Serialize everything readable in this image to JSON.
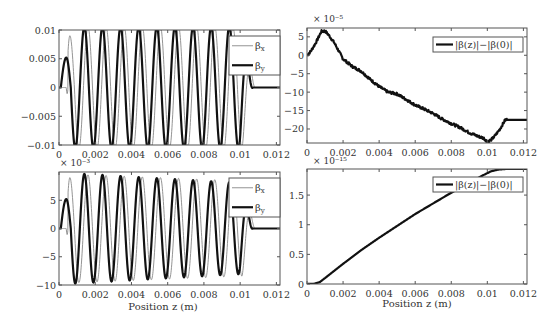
{
  "figure": {
    "width": 557,
    "height": 325,
    "background": "#ffffff",
    "axis_color": "#555555",
    "line_color": "#111111",
    "thin_line_color": "#888888"
  },
  "chart_data": [
    {
      "id": "top-left",
      "type": "line",
      "title": "",
      "xlabel": "",
      "ylabel": "",
      "xlim": [
        0,
        0.0122
      ],
      "ylim": [
        -0.01,
        0.01
      ],
      "xticks": [
        0,
        0.002,
        0.004,
        0.006,
        0.008,
        0.01,
        0.012
      ],
      "xtick_labels": [
        "0",
        "0.002",
        "0.004",
        "0.006",
        "0.008",
        "0.01",
        "0.012"
      ],
      "yticks": [
        -0.01,
        -0.005,
        0,
        0.005,
        0.01
      ],
      "ytick_labels": [
        "−0.01",
        "−0.005",
        "0",
        "0.005",
        "0.01"
      ],
      "exponent_label": "",
      "legend": {
        "position": "upper right",
        "entries": [
          "βx",
          "βy"
        ]
      },
      "series": [
        {
          "name": "βx",
          "style": "thin",
          "model": "oscillation",
          "start": 0.0004,
          "end": 0.0108,
          "period": 0.001,
          "phase": 0.5,
          "amp": 0.0106,
          "clip": 0.01,
          "ramp_amp": 0.009,
          "ramp_peak": 0.0006,
          "tail": 0.0,
          "dip_first": true
        },
        {
          "name": "βy",
          "style": "thick",
          "model": "oscillation",
          "start": 0.0001,
          "end": 0.0107,
          "period": 0.001,
          "phase": 0.0,
          "amp": 0.0106,
          "clip": 0.01,
          "ramp_amp": 0.0052,
          "ramp_peak": 0.0004,
          "tail": 0.0,
          "dip_first": false
        }
      ]
    },
    {
      "id": "top-right",
      "type": "line",
      "title": "",
      "xlabel": "",
      "ylabel": "",
      "xlim": [
        0,
        0.0122
      ],
      "ylim": [
        -23.8,
        7.4
      ],
      "xticks": [
        0,
        0.002,
        0.004,
        0.006,
        0.008,
        0.01,
        0.012
      ],
      "xtick_labels": [
        "0",
        "0.002",
        "0.004",
        "0.006",
        "0.008",
        "0.01",
        "0.012"
      ],
      "yticks": [
        -20,
        -15,
        -10,
        -5,
        0,
        5
      ],
      "ytick_labels": [
        "−20",
        "−15",
        "−10",
        "−5",
        "0",
        "5"
      ],
      "exponent_label": "× 10⁻⁵",
      "legend": {
        "position": "upper right",
        "entries": [
          "|β(z)|−|β(0)|"
        ]
      },
      "series": [
        {
          "name": "|β(z)|−|β(0)|",
          "style": "thick",
          "model": "points",
          "noise": 0.35,
          "x": [
            0,
            0.0002,
            0.0005,
            0.0008,
            0.001,
            0.0012,
            0.0015,
            0.002,
            0.0025,
            0.003,
            0.0035,
            0.004,
            0.0045,
            0.005,
            0.0055,
            0.006,
            0.0065,
            0.007,
            0.0075,
            0.008,
            0.0085,
            0.009,
            0.0095,
            0.0098,
            0.01,
            0.0102,
            0.0104,
            0.0107,
            0.011,
            0.0112,
            0.0122
          ],
          "y": [
            0,
            1.0,
            3.5,
            6.5,
            6.6,
            5.5,
            3.5,
            -1.0,
            -3.0,
            -4.3,
            -6.5,
            -8.5,
            -10.0,
            -10.5,
            -12.0,
            -13.5,
            -14.6,
            -15.8,
            -17.3,
            -18.5,
            -19.6,
            -21.0,
            -22.0,
            -22.5,
            -23.4,
            -23.0,
            -22.0,
            -20.0,
            -17.5,
            -17.5,
            -17.5
          ]
        }
      ]
    },
    {
      "id": "bottom-left",
      "type": "line",
      "title": "",
      "xlabel": "Position z (m)",
      "ylabel": "",
      "xlim": [
        0,
        0.0122
      ],
      "ylim": [
        -10,
        10
      ],
      "xticks": [
        0,
        0.002,
        0.004,
        0.006,
        0.008,
        0.01,
        0.012
      ],
      "xtick_labels": [
        "0",
        "0.002",
        "0.004",
        "0.006",
        "0.008",
        "0.01",
        "0.012"
      ],
      "yticks": [
        -10,
        -5,
        0,
        5
      ],
      "ytick_labels": [
        "−10",
        "−5",
        "0",
        "5"
      ],
      "exponent_label": "× 10⁻³",
      "legend": {
        "position": "upper right",
        "entries": [
          "βx",
          "βy"
        ]
      },
      "series": [
        {
          "name": "βx",
          "style": "thin",
          "model": "oscillation",
          "start": 0.0004,
          "end": 0.0108,
          "period": 0.001,
          "phase": 0.5,
          "amp": 9.6,
          "decay": 0.13,
          "clip": 10,
          "ramp_amp": 9.0,
          "ramp_peak": 0.0006,
          "tail": 0.0,
          "dip_first": true
        },
        {
          "name": "βy",
          "style": "thick",
          "model": "oscillation",
          "start": 0.0001,
          "end": 0.0107,
          "period": 0.001,
          "phase": 0.0,
          "amp": 9.8,
          "decay": 0.19,
          "clip": 10,
          "ramp_amp": 5.2,
          "ramp_peak": 0.0004,
          "tail": 0.0,
          "dip_first": false
        }
      ]
    },
    {
      "id": "bottom-right",
      "type": "line",
      "title": "",
      "xlabel": "Position z (m)",
      "ylabel": "",
      "xlim": [
        0,
        0.0122
      ],
      "ylim": [
        0,
        1.94
      ],
      "xticks": [
        0,
        0.002,
        0.004,
        0.006,
        0.008,
        0.01,
        0.012
      ],
      "xtick_labels": [
        "0",
        "0.002",
        "0.004",
        "0.006",
        "0.008",
        "0.01",
        "0.012"
      ],
      "yticks": [
        0,
        0.5,
        1,
        1.5
      ],
      "ytick_labels": [
        "0",
        "0.5",
        "1",
        "1.5"
      ],
      "exponent_label": "× 10⁻¹⁵",
      "legend": {
        "position": "upper right",
        "entries": [
          "|β(z)|−|β(0)|"
        ]
      },
      "series": [
        {
          "name": "|β(z)|−|β(0)|",
          "style": "thick",
          "model": "points",
          "noise": 0,
          "x": [
            0,
            0.0004,
            0.0007,
            0.001,
            0.0015,
            0.002,
            0.003,
            0.004,
            0.005,
            0.006,
            0.007,
            0.008,
            0.009,
            0.0098,
            0.0102,
            0.0106,
            0.011,
            0.0122
          ],
          "y": [
            0,
            0.005,
            0.03,
            0.1,
            0.22,
            0.34,
            0.57,
            0.78,
            0.98,
            1.18,
            1.36,
            1.54,
            1.71,
            1.84,
            1.9,
            1.93,
            1.94,
            1.94
          ]
        }
      ]
    }
  ]
}
